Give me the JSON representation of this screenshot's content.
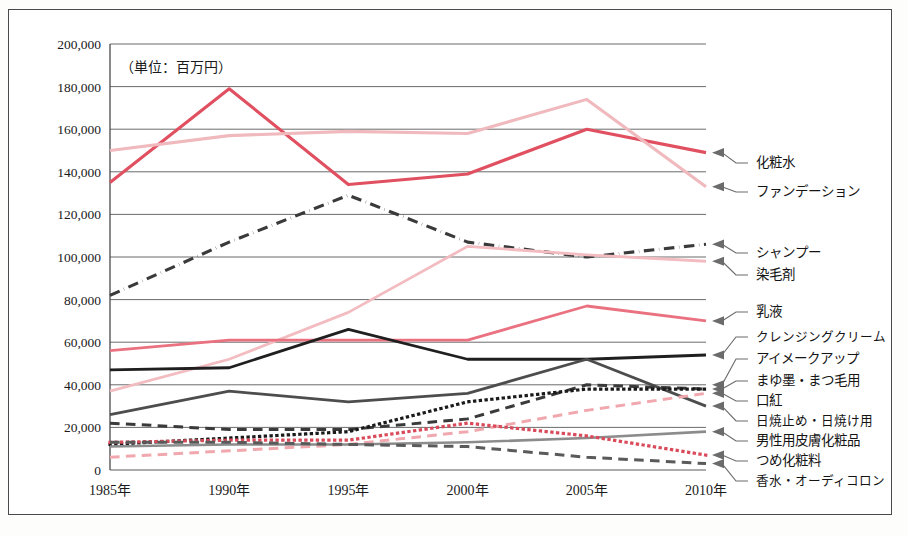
{
  "figure": {
    "unit_note": "（単位：百万円）",
    "border_color": "#4a4a4a",
    "background": "#ffffff"
  },
  "chart_data": {
    "type": "line",
    "title": "",
    "xlabel": "",
    "ylabel": "",
    "unit_note": "（単位：百万円）",
    "categories": [
      "1985年",
      "1990年",
      "1995年",
      "2000年",
      "2005年",
      "2010年"
    ],
    "x": [
      1985,
      1990,
      1995,
      2000,
      2005,
      2010
    ],
    "ylim": [
      0,
      200000
    ],
    "ytick_labels": [
      "0",
      "20,000",
      "40,000",
      "60,000",
      "80,000",
      "100,000",
      "120,000",
      "140,000",
      "160,000",
      "180,000",
      "200,000"
    ],
    "ytick_values": [
      0,
      20000,
      40000,
      60000,
      80000,
      100000,
      120000,
      140000,
      160000,
      180000,
      200000
    ],
    "grid": true,
    "legend_position": "right-callout",
    "series": [
      {
        "name": "化粧水",
        "color": "#e05060",
        "style": "solid",
        "width": 3.1,
        "values": [
          135000,
          179000,
          134000,
          139000,
          160000,
          149000
        ]
      },
      {
        "name": "ファンデーション",
        "color": "#f0b9bd",
        "style": "solid",
        "width": 3.1,
        "values": [
          150000,
          157000,
          159000,
          158000,
          174000,
          133000
        ]
      },
      {
        "name": "シャンプー",
        "color": "#3a3a3a",
        "style": "dashdot",
        "width": 3.1,
        "values": [
          82000,
          107000,
          129000,
          107000,
          100000,
          106000
        ]
      },
      {
        "name": "染毛剤",
        "color": "#f2bcc0",
        "style": "solid",
        "width": 2.8,
        "values": [
          37000,
          52000,
          74000,
          105000,
          101000,
          98000
        ]
      },
      {
        "name": "乳液",
        "color": "#ea7280",
        "style": "solid",
        "width": 2.8,
        "values": [
          56000,
          61000,
          61000,
          61000,
          77000,
          70000
        ]
      },
      {
        "name": "クレンジングクリーム",
        "color": "#1f1f1f",
        "style": "solid",
        "width": 2.8,
        "values": [
          47000,
          48000,
          66000,
          52000,
          52000,
          54000
        ]
      },
      {
        "name": "アイメークアップ",
        "color": "#4d4d4d",
        "style": "solid",
        "width": 2.8,
        "values": [
          26000,
          37000,
          32000,
          36000,
          52000,
          30000
        ]
      },
      {
        "name": "まゆ墨・まつ毛用",
        "color": "#3a3a3a",
        "style": "dashed",
        "width": 3.0,
        "values": [
          22000,
          19000,
          19000,
          24000,
          40000,
          38000
        ]
      },
      {
        "name": "口紅",
        "color": "#1a1a1a",
        "style": "dotted",
        "width": 3.2,
        "values": [
          12000,
          15000,
          18000,
          32000,
          38000,
          38000
        ]
      },
      {
        "name": "日焼止め・日焼け用",
        "color": "#f0a8ae",
        "style": "dashed",
        "width": 3.0,
        "values": [
          6000,
          9000,
          12000,
          18000,
          28000,
          36000
        ]
      },
      {
        "name": "男性用皮膚化粧品",
        "color": "#8c8c8c",
        "style": "solid",
        "width": 2.6,
        "values": [
          11000,
          12000,
          12000,
          13000,
          15000,
          18000
        ]
      },
      {
        "name": "つめ化粧料",
        "color": "#d94a5a",
        "style": "dotted",
        "width": 3.2,
        "values": [
          13000,
          14000,
          14000,
          22000,
          16000,
          7000
        ]
      },
      {
        "name": "香水・オーディコロン",
        "color": "#5a5a5a",
        "style": "dashed",
        "width": 3.0,
        "values": [
          13000,
          13000,
          12000,
          11000,
          6000,
          3000
        ]
      }
    ]
  },
  "callouts": [
    {
      "label": "化粧水",
      "anchor_value": 149000,
      "text_y": 163,
      "arrow_color": "#6b6b6b"
    },
    {
      "label": "ファンデーション",
      "anchor_value": 133000,
      "text_y": 192,
      "arrow_color": "#6b6b6b"
    },
    {
      "label": "シャンプー",
      "anchor_value": 106000,
      "text_y": 253,
      "arrow_color": "#6b6b6b"
    },
    {
      "label": "染毛剤",
      "anchor_value": 98000,
      "text_y": 275,
      "arrow_color": "#6b6b6b"
    },
    {
      "label": "乳液",
      "anchor_value": 70000,
      "text_y": 312,
      "arrow_color": "#6b6b6b"
    },
    {
      "label": "クレンジングクリーム",
      "anchor_value": 54000,
      "text_y": 337,
      "arrow_color": "#6b6b6b"
    },
    {
      "label": "アイメークアップ",
      "anchor_value": 40000,
      "text_y": 359,
      "arrow_color": "#6b6b6b"
    },
    {
      "label": "まゆ墨・まつ毛用",
      "anchor_value": 38000,
      "text_y": 381,
      "arrow_color": "#6b6b6b"
    },
    {
      "label": "口紅",
      "anchor_value": 36000,
      "text_y": 401,
      "arrow_color": "#6b6b6b"
    },
    {
      "label": "日焼止め・日焼け用",
      "anchor_value": 30000,
      "text_y": 421,
      "arrow_color": "#6b6b6b"
    },
    {
      "label": "男性用皮膚化粧品",
      "anchor_value": 18000,
      "text_y": 441,
      "arrow_color": "#6b6b6b"
    },
    {
      "label": "つめ化粧料",
      "anchor_value": 7000,
      "text_y": 461,
      "arrow_color": "#6b6b6b"
    },
    {
      "label": "香水・オーディコロン",
      "anchor_value": 3000,
      "text_y": 481,
      "arrow_color": "#6b6b6b"
    }
  ]
}
